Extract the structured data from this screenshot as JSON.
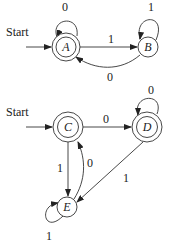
{
  "automaton1": {
    "start_label": "Start",
    "states": {
      "A": {
        "label": "A",
        "accepting": true
      },
      "B": {
        "label": "B",
        "accepting": false
      }
    },
    "edges": {
      "A_self": "0",
      "A_to_B": "1",
      "B_self": "1",
      "B_to_A": "0"
    }
  },
  "automaton2": {
    "start_label": "Start",
    "states": {
      "C": {
        "label": "C",
        "accepting": true
      },
      "D": {
        "label": "D",
        "accepting": true
      },
      "E": {
        "label": "E",
        "accepting": false
      }
    },
    "edges": {
      "C_to_D": "0",
      "D_self": "0",
      "C_to_E": "1",
      "E_to_C": "0",
      "D_to_E": "1",
      "E_self": "1"
    }
  }
}
